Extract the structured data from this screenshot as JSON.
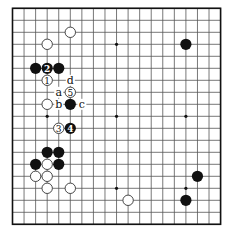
{
  "diagram": {
    "type": "go-board",
    "size": 19,
    "colors": {
      "background": "#ffffff",
      "grid_line": "#555555",
      "border": "#111111",
      "black_stone": "#111111",
      "white_stone_fill": "#ffffff",
      "white_stone_stroke": "#333333"
    },
    "star_points": [
      [
        3,
        3
      ],
      [
        9,
        3
      ],
      [
        15,
        3
      ],
      [
        3,
        9
      ],
      [
        9,
        9
      ],
      [
        15,
        9
      ],
      [
        3,
        15
      ],
      [
        9,
        15
      ],
      [
        15,
        15
      ]
    ],
    "stones": [
      {
        "color": "white",
        "col": 5,
        "row": 2,
        "label": ""
      },
      {
        "color": "white",
        "col": 3,
        "row": 3,
        "label": ""
      },
      {
        "color": "black",
        "col": 15,
        "row": 3,
        "label": ""
      },
      {
        "color": "black",
        "col": 2,
        "row": 5,
        "label": ""
      },
      {
        "color": "black",
        "col": 3,
        "row": 5,
        "label": "2"
      },
      {
        "color": "black",
        "col": 4,
        "row": 5,
        "label": ""
      },
      {
        "color": "white",
        "col": 3,
        "row": 6,
        "label": "1"
      },
      {
        "color": "white",
        "col": 5,
        "row": 7,
        "label": "5"
      },
      {
        "color": "white",
        "col": 3,
        "row": 8,
        "label": ""
      },
      {
        "color": "black",
        "col": 5,
        "row": 8,
        "label": ""
      },
      {
        "color": "white",
        "col": 4,
        "row": 10,
        "label": "3"
      },
      {
        "color": "black",
        "col": 5,
        "row": 10,
        "label": "4"
      },
      {
        "color": "black",
        "col": 3,
        "row": 12,
        "label": ""
      },
      {
        "color": "black",
        "col": 4,
        "row": 12,
        "label": ""
      },
      {
        "color": "black",
        "col": 2,
        "row": 13,
        "label": ""
      },
      {
        "color": "white",
        "col": 3,
        "row": 13,
        "label": ""
      },
      {
        "color": "black",
        "col": 4,
        "row": 13,
        "label": ""
      },
      {
        "color": "white",
        "col": 2,
        "row": 14,
        "label": ""
      },
      {
        "color": "white",
        "col": 3,
        "row": 14,
        "label": ""
      },
      {
        "color": "black",
        "col": 16,
        "row": 14,
        "label": ""
      },
      {
        "color": "white",
        "col": 3,
        "row": 15,
        "label": ""
      },
      {
        "color": "white",
        "col": 5,
        "row": 15,
        "label": ""
      },
      {
        "color": "white",
        "col": 10,
        "row": 16,
        "label": ""
      },
      {
        "color": "black",
        "col": 15,
        "row": 16,
        "label": ""
      }
    ],
    "letter_marks": [
      {
        "col": 5,
        "row": 6,
        "label": "d"
      },
      {
        "col": 4,
        "row": 7,
        "label": "a"
      },
      {
        "col": 4,
        "row": 8,
        "label": "b"
      },
      {
        "col": 6,
        "row": 8,
        "label": "c"
      }
    ]
  }
}
